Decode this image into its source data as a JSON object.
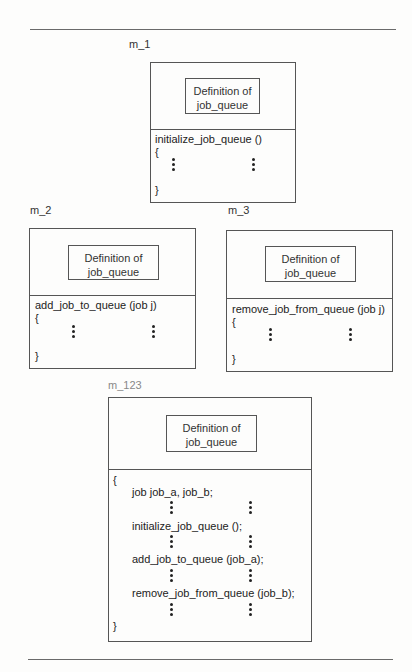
{
  "diagram": {
    "type": "module-structure",
    "modules": [
      {
        "id": "m_1",
        "label": "m_1",
        "definition": [
          "Definition of",
          "job_queue"
        ],
        "signature": "initialize_job_queue ()",
        "open_brace": "{",
        "close_brace": "}"
      },
      {
        "id": "m_2",
        "label": "m_2",
        "definition": [
          "Definition of",
          "job_queue"
        ],
        "signature": "add_job_to_queue (job j)",
        "open_brace": "{",
        "close_brace": "}"
      },
      {
        "id": "m_3",
        "label": "m_3",
        "definition": [
          "Definition of",
          "job_queue"
        ],
        "signature": "remove_job_from_queue (job j)",
        "open_brace": "{",
        "close_brace": "}"
      },
      {
        "id": "m_123",
        "label": "m_123",
        "definition": [
          "Definition of",
          "job_queue"
        ],
        "open_brace": "{",
        "statements": [
          "job job_a, job_b;",
          "initialize_job_queue ();",
          "add_job_to_queue (job_a);",
          "remove_job_from_queue (job_b);"
        ],
        "close_brace": "}"
      }
    ]
  }
}
